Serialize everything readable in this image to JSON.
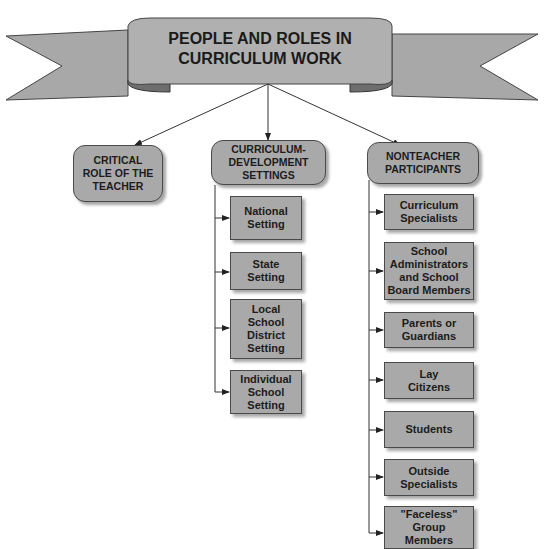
{
  "banner": {
    "title": "PEOPLE AND ROLES IN\nCURRICULUM WORK"
  },
  "categories": [
    {
      "label": "CRITICAL\nROLE OF THE\nTEACHER"
    },
    {
      "label": "CURRICULUM-\nDEVELOPMENT\nSETTINGS"
    },
    {
      "label": "NONTEACHER\nPARTICIPANTS"
    }
  ],
  "settings": [
    {
      "label": "National\nSetting"
    },
    {
      "label": "State\nSetting"
    },
    {
      "label": "Local\nSchool\nDistrict\nSetting"
    },
    {
      "label": "Individual\nSchool\nSetting"
    }
  ],
  "participants": [
    {
      "label": "Curriculum\nSpecialists"
    },
    {
      "label": "School\nAdministrators\nand School\nBoard Members"
    },
    {
      "label": "Parents or\nGuardians"
    },
    {
      "label": "Lay\nCitizens"
    },
    {
      "label": "Students"
    },
    {
      "label": "Outside\nSpecialists"
    },
    {
      "label": "\"Faceless\"\nGroup\nMembers"
    }
  ],
  "colors": {
    "box_fill": "#a9a9a9",
    "border": "#4a4a4a",
    "banner_dark": "#6e6e6e"
  }
}
